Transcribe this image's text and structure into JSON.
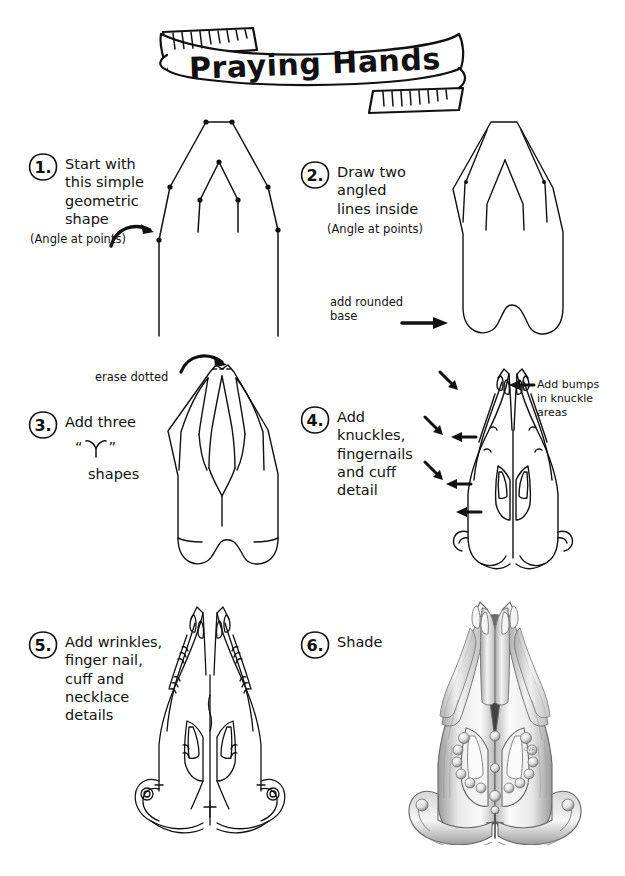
{
  "document": {
    "title": "Praying Hands",
    "type": "step-by-step drawing tutorial",
    "signature": "CVR",
    "ink_color": "#111111",
    "paper_color": "#ffffff"
  },
  "banner": {
    "title": "Praying Hands"
  },
  "steps": [
    {
      "number": "1.",
      "instruction": "Start with\nthis simple\ngeometric\nshape",
      "notes": [
        {
          "name": "angle-at-points-note",
          "text": "(Angle at points)"
        }
      ],
      "figure": "geometric-outline-with-points"
    },
    {
      "number": "2.",
      "instruction": "Draw two angled\nlines inside",
      "notes": [
        {
          "name": "angle-at-points-note",
          "text": "(Angle at points)"
        },
        {
          "name": "add-rounded-base-note",
          "text": "add rounded\nbase"
        }
      ],
      "figure": "outline-with-inner-lines"
    },
    {
      "number": "3.",
      "instruction": "Add three",
      "instruction_suffix": "shapes",
      "quote_open": "“",
      "quote_close": "”",
      "glyph": "Y",
      "notes": [
        {
          "name": "erase-dotted-note",
          "text": "erase dotted"
        }
      ],
      "figure": "three-y-shapes"
    },
    {
      "number": "4.",
      "instruction": "Add knuckles,\nfingernails\nand cuff\ndetail",
      "notes": [
        {
          "name": "add-bumps-note",
          "text": "Add bumps\nin knuckle\nareas"
        }
      ],
      "figure": "knuckles-fingernails-cuff"
    },
    {
      "number": "5.",
      "instruction": "Add wrinkles,\nfinger nail,\ncuff and\nnecklace\ndetails",
      "notes": [],
      "figure": "wrinkles-cuff-necklace"
    },
    {
      "number": "6.",
      "instruction": "Shade",
      "notes": [],
      "figure": "shaded-final"
    }
  ]
}
